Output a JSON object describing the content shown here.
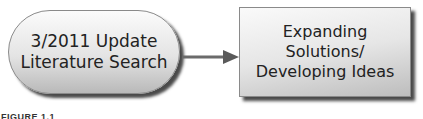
{
  "diagram": {
    "nodes": [
      {
        "id": "literature-search",
        "shape": "rounded-pill",
        "lines": [
          "3/2011 Update",
          "Literature Search"
        ]
      },
      {
        "id": "expanding-solutions",
        "shape": "rectangle",
        "lines": [
          "Expanding",
          "Solutions/",
          "Developing Ideas"
        ]
      }
    ],
    "edges": [
      {
        "from": "literature-search",
        "to": "expanding-solutions",
        "style": "arrow"
      }
    ],
    "caption": "FIGURE 1.1",
    "colors": {
      "node_fill_top": "#fbfbfb",
      "node_fill_bottom": "#b9b9b9",
      "node_border": "#8a8a8a",
      "shadow": "#4a4a4a",
      "arrow": "#6b6b6b",
      "text": "#222222"
    }
  }
}
